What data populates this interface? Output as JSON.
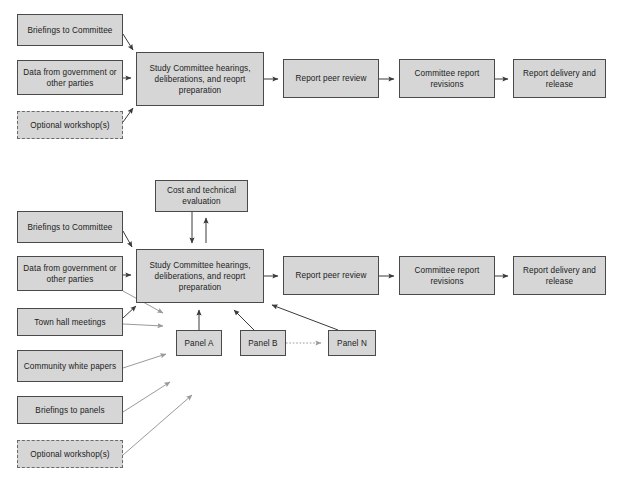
{
  "diagram": {
    "type": "flowchart",
    "colors": {
      "node_fill": "#d6d6d6",
      "node_border": "#4a4a4a",
      "dashed_border": "#6a6a6a",
      "arrow_dark": "#3a3a3a",
      "arrow_gray": "#9a9a9a",
      "text": "#1b1b1b",
      "footnote": "#8d8d8d",
      "background": "#ffffff"
    },
    "panels": [
      {
        "id": "top",
        "name": "basic-process-flow",
        "nodes": [
          {
            "id": "t-briefings",
            "label": "Briefings to Committee",
            "style": "solid",
            "x": 17,
            "y": 14,
            "w": 106,
            "h": 32
          },
          {
            "id": "t-data",
            "label": "Data from government or other parties",
            "style": "solid",
            "x": 17,
            "y": 60,
            "w": 106,
            "h": 35
          },
          {
            "id": "t-workshop",
            "label": "Optional workshop(s)",
            "style": "dashed",
            "x": 17,
            "y": 111,
            "w": 106,
            "h": 28
          },
          {
            "id": "t-study",
            "label": "Study Committee hearings, deliberations, and reoprt preparation",
            "style": "solid",
            "x": 136,
            "y": 52,
            "w": 128,
            "h": 54
          },
          {
            "id": "t-peer",
            "label": "Report peer review",
            "style": "solid",
            "x": 283,
            "y": 59,
            "w": 96,
            "h": 39
          },
          {
            "id": "t-revisions",
            "label": "Committee report revisions",
            "style": "solid",
            "x": 399,
            "y": 59,
            "w": 96,
            "h": 39
          },
          {
            "id": "t-delivery",
            "label": "Report delivery and release",
            "style": "solid",
            "x": 513,
            "y": 59,
            "w": 93,
            "h": 39
          }
        ],
        "edges": [
          {
            "from": "t-briefings",
            "to": "t-study",
            "kind": "solid-dark"
          },
          {
            "from": "t-data",
            "to": "t-study",
            "kind": "solid-dark"
          },
          {
            "from": "t-workshop",
            "to": "t-study",
            "kind": "solid-dark"
          },
          {
            "from": "t-study",
            "to": "t-peer",
            "kind": "solid-dark"
          },
          {
            "from": "t-peer",
            "to": "t-revisions",
            "kind": "solid-dark"
          },
          {
            "from": "t-revisions",
            "to": "t-delivery",
            "kind": "solid-dark"
          }
        ]
      },
      {
        "id": "bottom",
        "name": "expanded-process-flow-with-panels",
        "nodes": [
          {
            "id": "b-cost",
            "label": "Cost and technical evaluation",
            "style": "solid",
            "x": 155,
            "y": 180,
            "w": 93,
            "h": 32
          },
          {
            "id": "b-briefings",
            "label": "Briefings to Committee",
            "style": "solid",
            "x": 17,
            "y": 211,
            "w": 106,
            "h": 32
          },
          {
            "id": "b-data",
            "label": "Data from government or other parties",
            "style": "solid",
            "x": 17,
            "y": 256,
            "w": 106,
            "h": 35
          },
          {
            "id": "b-townhall",
            "label": "Town hall meetings",
            "style": "solid",
            "x": 17,
            "y": 308,
            "w": 106,
            "h": 28
          },
          {
            "id": "b-community",
            "label": "Community white papers",
            "style": "solid",
            "x": 17,
            "y": 350,
            "w": 106,
            "h": 32
          },
          {
            "id": "b-panelbrief",
            "label": "Briefings to panels",
            "style": "solid",
            "x": 17,
            "y": 396,
            "w": 106,
            "h": 28
          },
          {
            "id": "b-workshop",
            "label": "Optional workshop(s)",
            "style": "dashed",
            "x": 17,
            "y": 440,
            "w": 106,
            "h": 28
          },
          {
            "id": "b-study",
            "label": "Study Committee hearings, deliberations, and reoprt preparation",
            "style": "solid",
            "x": 136,
            "y": 249,
            "w": 128,
            "h": 54
          },
          {
            "id": "b-panelA",
            "label": "Panel A",
            "style": "solid",
            "x": 176,
            "y": 330,
            "w": 46,
            "h": 26
          },
          {
            "id": "b-panelB",
            "label": "Panel B",
            "style": "solid",
            "x": 240,
            "y": 330,
            "w": 46,
            "h": 26
          },
          {
            "id": "b-panelN",
            "label": "Panel N",
            "style": "solid",
            "x": 328,
            "y": 330,
            "w": 48,
            "h": 26
          },
          {
            "id": "b-peer",
            "label": "Report peer review",
            "style": "solid",
            "x": 283,
            "y": 256,
            "w": 96,
            "h": 39
          },
          {
            "id": "b-revisions",
            "label": "Committee report revisions",
            "style": "solid",
            "x": 399,
            "y": 256,
            "w": 96,
            "h": 39
          },
          {
            "id": "b-delivery",
            "label": "Report delivery and release",
            "style": "solid",
            "x": 513,
            "y": 256,
            "w": 93,
            "h": 39
          }
        ],
        "edges": [
          {
            "from": "b-study",
            "to": "b-cost",
            "kind": "solid-dark"
          },
          {
            "from": "b-cost",
            "to": "b-study",
            "kind": "solid-dark"
          },
          {
            "from": "b-briefings",
            "to": "b-study",
            "kind": "solid-dark"
          },
          {
            "from": "b-data",
            "to": "b-study",
            "kind": "solid-dark"
          },
          {
            "from": "b-townhall",
            "to": "b-study",
            "kind": "solid-dark"
          },
          {
            "from": "b-data",
            "to": "b-panels",
            "kind": "solid-gray"
          },
          {
            "from": "b-townhall",
            "to": "b-panels",
            "kind": "solid-gray"
          },
          {
            "from": "b-community",
            "to": "b-panels",
            "kind": "solid-gray"
          },
          {
            "from": "b-panelbrief",
            "to": "b-panels",
            "kind": "solid-gray"
          },
          {
            "from": "b-workshop",
            "to": "b-panels",
            "kind": "solid-gray"
          },
          {
            "from": "b-panelA",
            "to": "b-study",
            "kind": "solid-dark"
          },
          {
            "from": "b-panelB",
            "to": "b-study",
            "kind": "solid-dark"
          },
          {
            "from": "b-panelN",
            "to": "b-study",
            "kind": "solid-dark"
          },
          {
            "from": "b-panelB",
            "to": "b-panelN",
            "kind": "dotted-gray"
          },
          {
            "from": "b-study",
            "to": "b-peer",
            "kind": "solid-dark"
          },
          {
            "from": "b-peer",
            "to": "b-revisions",
            "kind": "solid-dark"
          },
          {
            "from": "b-revisions",
            "to": "b-delivery",
            "kind": "solid-dark"
          }
        ]
      }
    ],
    "footnote": {
      "text": "",
      "x": 395,
      "y": 492
    }
  }
}
